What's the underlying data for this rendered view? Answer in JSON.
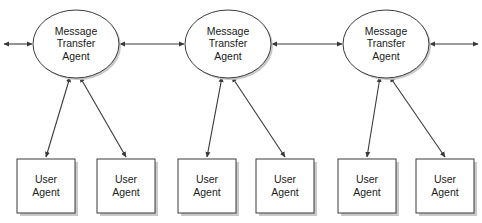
{
  "diagram": {
    "background_color": "#ffffff",
    "stroke_color": "#3a3a3a",
    "text_color": "#1a1a1a",
    "shadow_color": "#c9c9c9",
    "mta_nodes": [
      {
        "id": "mta-1",
        "line1": "Message",
        "line2": "Transfer",
        "line3": "Agent",
        "cx": 76,
        "cy": 44,
        "rx": 43,
        "ry": 34
      },
      {
        "id": "mta-2",
        "line1": "Message",
        "line2": "Transfer",
        "line3": "Agent",
        "cx": 228,
        "cy": 44,
        "rx": 43,
        "ry": 34
      },
      {
        "id": "mta-3",
        "line1": "Message",
        "line2": "Transfer",
        "line3": "Agent",
        "cx": 386,
        "cy": 44,
        "rx": 43,
        "ry": 34
      }
    ],
    "ua_nodes": [
      {
        "id": "ua-1",
        "line1": "User",
        "line2": "Agent",
        "x": 17,
        "y": 159,
        "w": 58,
        "h": 54
      },
      {
        "id": "ua-2",
        "line1": "User",
        "line2": "Agent",
        "x": 97,
        "y": 159,
        "w": 58,
        "h": 54
      },
      {
        "id": "ua-3",
        "line1": "User",
        "line2": "Agent",
        "x": 178,
        "y": 159,
        "w": 58,
        "h": 54
      },
      {
        "id": "ua-4",
        "line1": "User",
        "line2": "Agent",
        "x": 256,
        "y": 159,
        "w": 58,
        "h": 54
      },
      {
        "id": "ua-5",
        "line1": "User",
        "line2": "Agent",
        "x": 338,
        "y": 159,
        "w": 58,
        "h": 54
      },
      {
        "id": "ua-6",
        "line1": "User",
        "line2": "Agent",
        "x": 416,
        "y": 159,
        "w": 58,
        "h": 54
      }
    ],
    "links": [
      {
        "id": "link-external-left",
        "from": "edge-left",
        "to": "mta-1",
        "x1": 4,
        "y1": 44,
        "x2": 32,
        "y2": 44,
        "arrow_start": true,
        "arrow_end": true
      },
      {
        "id": "link-mta1-mta2",
        "from": "mta-1",
        "to": "mta-2",
        "x1": 120,
        "y1": 44,
        "x2": 184,
        "y2": 44,
        "arrow_start": true,
        "arrow_end": true
      },
      {
        "id": "link-mta2-mta3",
        "from": "mta-2",
        "to": "mta-3",
        "x1": 272,
        "y1": 44,
        "x2": 342,
        "y2": 44,
        "arrow_start": true,
        "arrow_end": true
      },
      {
        "id": "link-external-right",
        "from": "mta-3",
        "to": "edge-right",
        "x1": 430,
        "y1": 44,
        "x2": 478,
        "y2": 44,
        "arrow_start": true,
        "arrow_end": true
      },
      {
        "id": "link-mta1-ua1",
        "from": "mta-1",
        "to": "ua-1",
        "x1": 70,
        "y1": 77,
        "x2": 46,
        "y2": 157,
        "arrow_start": true,
        "arrow_end": true
      },
      {
        "id": "link-mta1-ua2",
        "from": "mta-1",
        "to": "ua-2",
        "x1": 80,
        "y1": 77,
        "x2": 126,
        "y2": 157,
        "arrow_start": true,
        "arrow_end": true
      },
      {
        "id": "link-mta2-ua3",
        "from": "mta-2",
        "to": "ua-3",
        "x1": 222,
        "y1": 77,
        "x2": 207,
        "y2": 157,
        "arrow_start": true,
        "arrow_end": true
      },
      {
        "id": "link-mta2-ua4",
        "from": "mta-2",
        "to": "ua-4",
        "x1": 232,
        "y1": 77,
        "x2": 285,
        "y2": 157,
        "arrow_start": true,
        "arrow_end": true
      },
      {
        "id": "link-mta3-ua5",
        "from": "mta-3",
        "to": "ua-5",
        "x1": 380,
        "y1": 77,
        "x2": 367,
        "y2": 157,
        "arrow_start": true,
        "arrow_end": true
      },
      {
        "id": "link-mta3-ua6",
        "from": "mta-3",
        "to": "ua-6",
        "x1": 390,
        "y1": 77,
        "x2": 445,
        "y2": 157,
        "arrow_start": true,
        "arrow_end": true
      }
    ]
  }
}
